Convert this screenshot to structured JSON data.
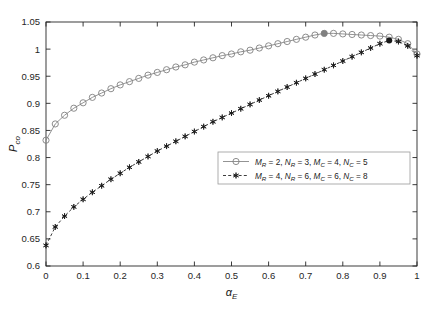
{
  "chart_data": {
    "type": "line",
    "title": "",
    "xlabel": "α_E",
    "xlabel_base": "α",
    "xlabel_sub": "E",
    "ylabel": "P_co",
    "ylabel_base": "P",
    "ylabel_sub": "co",
    "xlim": [
      0,
      1
    ],
    "ylim": [
      0.6,
      1.05
    ],
    "grid": false,
    "legend_position": "lower-right-inside",
    "xticks": [
      0,
      0.1,
      0.2,
      0.3,
      0.4,
      0.5,
      0.6,
      0.7,
      0.8,
      0.9,
      1
    ],
    "xtick_labels": [
      "0",
      "0.1",
      "0.2",
      "0.3",
      "0.4",
      "0.5",
      "0.6",
      "0.7",
      "0.8",
      "0.9",
      "1"
    ],
    "yticks": [
      0.6,
      0.65,
      0.7,
      0.75,
      0.8,
      0.85,
      0.9,
      0.95,
      1,
      1.05
    ],
    "ytick_labels": [
      "0.6",
      "0.65",
      "0.7",
      "0.75",
      "0.8",
      "0.85",
      "0.9",
      "0.95",
      "1",
      "1.05"
    ],
    "series": [
      {
        "name": "M_R = 2, N_R = 3, M_C = 4, N_C = 5",
        "marker": "circle-open",
        "color": "#808080",
        "linestyle": "solid",
        "max_marker_x": 0.75,
        "max_marker_y": 1.029,
        "x": [
          0.0,
          0.025,
          0.05,
          0.075,
          0.1,
          0.125,
          0.15,
          0.175,
          0.2,
          0.225,
          0.25,
          0.275,
          0.3,
          0.325,
          0.35,
          0.375,
          0.4,
          0.425,
          0.45,
          0.475,
          0.5,
          0.525,
          0.55,
          0.575,
          0.6,
          0.625,
          0.65,
          0.675,
          0.7,
          0.725,
          0.75,
          0.775,
          0.8,
          0.825,
          0.85,
          0.875,
          0.9,
          0.925,
          0.95,
          0.975,
          1.0
        ],
        "y": [
          0.832,
          0.862,
          0.878,
          0.891,
          0.901,
          0.911,
          0.919,
          0.927,
          0.934,
          0.94,
          0.946,
          0.952,
          0.957,
          0.962,
          0.967,
          0.971,
          0.976,
          0.98,
          0.984,
          0.988,
          0.991,
          0.995,
          0.998,
          1.002,
          1.006,
          1.01,
          1.014,
          1.018,
          1.022,
          1.026,
          1.029,
          1.029,
          1.028,
          1.027,
          1.026,
          1.025,
          1.024,
          1.022,
          1.018,
          1.01,
          0.991
        ]
      },
      {
        "name": "M_R = 4, N_R = 6, M_C = 6, N_C = 8",
        "marker": "asterisk",
        "color": "#1a1a1a",
        "linestyle": "dashed",
        "max_marker_x": 0.925,
        "max_marker_y": 1.016,
        "x": [
          0.0,
          0.025,
          0.05,
          0.075,
          0.1,
          0.125,
          0.15,
          0.175,
          0.2,
          0.225,
          0.25,
          0.275,
          0.3,
          0.325,
          0.35,
          0.375,
          0.4,
          0.425,
          0.45,
          0.475,
          0.5,
          0.525,
          0.55,
          0.575,
          0.6,
          0.625,
          0.65,
          0.675,
          0.7,
          0.725,
          0.75,
          0.775,
          0.8,
          0.825,
          0.85,
          0.875,
          0.9,
          0.925,
          0.95,
          0.975,
          1.0
        ],
        "y": [
          0.638,
          0.672,
          0.692,
          0.709,
          0.723,
          0.736,
          0.748,
          0.76,
          0.771,
          0.782,
          0.792,
          0.802,
          0.812,
          0.821,
          0.83,
          0.839,
          0.848,
          0.857,
          0.866,
          0.874,
          0.882,
          0.89,
          0.898,
          0.906,
          0.914,
          0.922,
          0.93,
          0.938,
          0.946,
          0.954,
          0.962,
          0.97,
          0.978,
          0.986,
          0.994,
          1.002,
          1.01,
          1.016,
          1.014,
          1.006,
          0.988
        ]
      }
    ],
    "legend": [
      {
        "marker": "circle-open",
        "linestyle": "solid",
        "parts": [
          {
            "base": "M",
            "sub": "R",
            "val": " = 2, "
          },
          {
            "base": "N",
            "sub": "R",
            "val": " = 3, "
          },
          {
            "base": "M",
            "sub": "C",
            "val": " = 4, "
          },
          {
            "base": "N",
            "sub": "C",
            "val": " = 5"
          }
        ]
      },
      {
        "marker": "asterisk",
        "linestyle": "dashed",
        "parts": [
          {
            "base": "M",
            "sub": "R",
            "val": " = 4, "
          },
          {
            "base": "N",
            "sub": "R",
            "val": " = 6, "
          },
          {
            "base": "M",
            "sub": "C",
            "val": " = 6, "
          },
          {
            "base": "N",
            "sub": "C",
            "val": " = 8"
          }
        ]
      }
    ]
  },
  "colors": {
    "axis": "#262626",
    "series1": "#808080",
    "series2": "#1a1a1a",
    "background": "#ffffff",
    "legend_border": "#999999"
  }
}
